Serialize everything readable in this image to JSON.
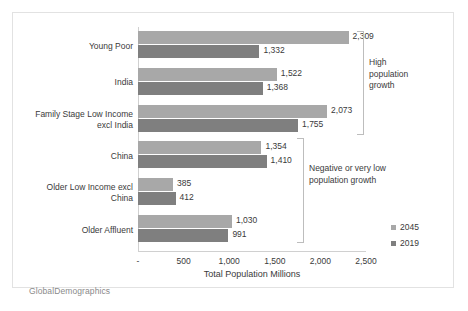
{
  "chart_data": {
    "type": "bar",
    "orientation": "horizontal",
    "title": "",
    "xlabel": "Total Population Millions",
    "ylabel": "",
    "xlim": [
      0,
      2500
    ],
    "xticks": [
      "-",
      "500",
      "1,000",
      "1,500",
      "2,000",
      "2,500"
    ],
    "xtick_values": [
      0,
      500,
      1000,
      1500,
      2000,
      2500
    ],
    "grid": false,
    "legend_position": "right",
    "categories": [
      "Young Poor",
      "India",
      "Family Stage Low Income excl India",
      "China",
      "Older Low Income excl China",
      "Older Affluent"
    ],
    "category_lines": [
      [
        "Young Poor"
      ],
      [
        "India"
      ],
      [
        "Family Stage Low Income",
        "excl India"
      ],
      [
        "China"
      ],
      [
        "Older Low Income excl",
        "China"
      ],
      [
        "Older Affluent"
      ]
    ],
    "series": [
      {
        "name": "2045",
        "color": "#a8a8a8",
        "values": [
          2309,
          1522,
          2073,
          1354,
          385,
          1030
        ],
        "labels": [
          "2,309",
          "1,522",
          "2,073",
          "1,354",
          "385",
          "1,030"
        ]
      },
      {
        "name": "2019",
        "color": "#7f7f7f",
        "values": [
          1332,
          1368,
          1755,
          1410,
          412,
          991
        ],
        "labels": [
          "1,332",
          "1,368",
          "1,755",
          "1,410",
          "412",
          "991"
        ]
      }
    ],
    "annotations": [
      {
        "lines": [
          "High",
          "population",
          "growth"
        ],
        "covers_categories": [
          "Young Poor",
          "India",
          "Family Stage Low Income excl India"
        ]
      },
      {
        "lines": [
          "Negative or very low",
          "population growth"
        ],
        "covers_categories": [
          "China",
          "Older Low Income excl China",
          "Older Affluent"
        ]
      }
    ]
  },
  "legend": {
    "items": [
      {
        "label": "2045",
        "color": "#a8a8a8"
      },
      {
        "label": "2019",
        "color": "#7f7f7f"
      }
    ]
  },
  "branding": {
    "text": "GlobalDemographics"
  }
}
